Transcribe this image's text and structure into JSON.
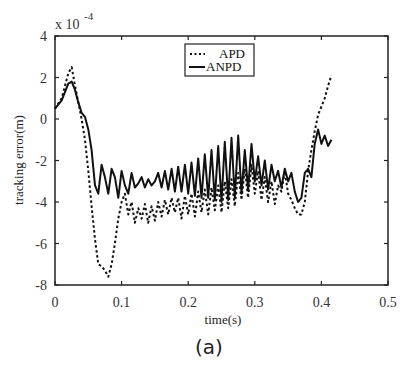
{
  "chart_data": {
    "type": "line",
    "title": "",
    "xlabel": "time(s)",
    "ylabel": "tracking error(m)",
    "y_scale_note": "x 10",
    "y_scale_exponent": "-4",
    "xlim": [
      0,
      0.5
    ],
    "ylim": [
      -8,
      4
    ],
    "xticks": [
      "0",
      "0.1",
      "0.2",
      "0.3",
      "0.4",
      "0.5"
    ],
    "yticks": [
      "4",
      "2",
      "0",
      "-2",
      "-4",
      "-6",
      "-8"
    ],
    "grid": false,
    "legend_position": "top-center",
    "caption": "(a)",
    "series": [
      {
        "name": "APD",
        "style": "dotted",
        "x": [
          0,
          0.01,
          0.02,
          0.025,
          0.03,
          0.035,
          0.04,
          0.045,
          0.05,
          0.055,
          0.06,
          0.065,
          0.07,
          0.075,
          0.08,
          0.085,
          0.09,
          0.095,
          0.1,
          0.105,
          0.11,
          0.115,
          0.12,
          0.125,
          0.13,
          0.135,
          0.14,
          0.145,
          0.15,
          0.155,
          0.16,
          0.165,
          0.17,
          0.175,
          0.18,
          0.185,
          0.19,
          0.195,
          0.2,
          0.205,
          0.21,
          0.215,
          0.22,
          0.225,
          0.23,
          0.235,
          0.24,
          0.245,
          0.25,
          0.255,
          0.26,
          0.265,
          0.27,
          0.275,
          0.28,
          0.285,
          0.29,
          0.295,
          0.3,
          0.305,
          0.31,
          0.315,
          0.32,
          0.325,
          0.33,
          0.335,
          0.34,
          0.345,
          0.35,
          0.355,
          0.36,
          0.365,
          0.37,
          0.375,
          0.38,
          0.385,
          0.39,
          0.395,
          0.4,
          0.405,
          0.41,
          0.415
        ],
        "y": [
          0.5,
          1.0,
          2.2,
          2.5,
          1.6,
          0.8,
          0.0,
          -1.0,
          -2.5,
          -4.2,
          -5.8,
          -7.0,
          -7.1,
          -7.3,
          -7.6,
          -7.0,
          -6.0,
          -4.8,
          -4.0,
          -3.6,
          -4.6,
          -4.0,
          -5.0,
          -4.3,
          -4.8,
          -4.1,
          -5.0,
          -4.2,
          -4.9,
          -4.0,
          -4.7,
          -3.9,
          -4.6,
          -3.8,
          -4.5,
          -3.8,
          -4.8,
          -3.7,
          -4.6,
          -3.6,
          -4.7,
          -3.5,
          -4.5,
          -3.4,
          -4.6,
          -3.3,
          -4.4,
          -3.2,
          -4.5,
          -3.0,
          -4.3,
          -2.9,
          -4.2,
          -2.6,
          -3.9,
          -2.4,
          -3.8,
          -2.2,
          -3.6,
          -2.5,
          -3.9,
          -2.8,
          -4.0,
          -3.0,
          -4.1,
          -3.2,
          -3.5,
          -2.5,
          -3.6,
          -3.9,
          -4.3,
          -4.6,
          -4.6,
          -4.0,
          -2.5,
          -1.5,
          -0.6,
          0.2,
          0.6,
          1.0,
          1.6,
          2.1
        ]
      },
      {
        "name": "ANPD",
        "style": "solid",
        "x": [
          0,
          0.01,
          0.02,
          0.025,
          0.03,
          0.035,
          0.04,
          0.045,
          0.05,
          0.055,
          0.06,
          0.065,
          0.07,
          0.075,
          0.08,
          0.085,
          0.09,
          0.095,
          0.1,
          0.105,
          0.11,
          0.115,
          0.12,
          0.125,
          0.13,
          0.135,
          0.14,
          0.145,
          0.15,
          0.155,
          0.16,
          0.165,
          0.17,
          0.175,
          0.18,
          0.185,
          0.19,
          0.195,
          0.2,
          0.205,
          0.21,
          0.215,
          0.22,
          0.225,
          0.23,
          0.235,
          0.24,
          0.245,
          0.25,
          0.255,
          0.26,
          0.265,
          0.27,
          0.275,
          0.28,
          0.285,
          0.29,
          0.295,
          0.3,
          0.305,
          0.31,
          0.315,
          0.32,
          0.325,
          0.33,
          0.335,
          0.34,
          0.345,
          0.35,
          0.355,
          0.36,
          0.365,
          0.37,
          0.375,
          0.38,
          0.385,
          0.39,
          0.395,
          0.4,
          0.405,
          0.41,
          0.415
        ],
        "y": [
          0.5,
          0.9,
          1.7,
          1.8,
          1.4,
          0.8,
          0.3,
          0.1,
          -0.5,
          -1.5,
          -3.2,
          -3.6,
          -2.2,
          -2.8,
          -3.6,
          -2.4,
          -2.8,
          -3.8,
          -2.5,
          -3.2,
          -3.6,
          -2.6,
          -3.3,
          -3.1,
          -2.8,
          -3.3,
          -2.9,
          -3.2,
          -3.0,
          -2.6,
          -3.3,
          -2.5,
          -3.4,
          -2.4,
          -3.5,
          -2.3,
          -3.5,
          -2.2,
          -3.6,
          -2.1,
          -3.7,
          -1.9,
          -3.8,
          -1.7,
          -3.8,
          -1.5,
          -3.9,
          -1.3,
          -4.0,
          -1.1,
          -3.9,
          -0.9,
          -3.8,
          -0.8,
          -3.6,
          -1.5,
          -3.4,
          -1.2,
          -3.0,
          -1.8,
          -3.2,
          -2.0,
          -3.4,
          -2.2,
          -3.0,
          -2.5,
          -3.3,
          -2.4,
          -3.0,
          -2.6,
          -3.5,
          -4.0,
          -3.8,
          -2.6,
          -2.4,
          -2.8,
          -1.2,
          -0.5,
          -1.2,
          -0.8,
          -1.3,
          -1.0
        ]
      }
    ]
  },
  "axes": {
    "xlabel": "time(s)",
    "ylabel": "tracking error(m)",
    "scale_prefix": "x 10",
    "scale_exp": "-4"
  },
  "legend": {
    "items": [
      {
        "label": "APD",
        "style": "dotted"
      },
      {
        "label": "ANPD",
        "style": "solid"
      }
    ]
  },
  "caption": "(a)",
  "colors": {
    "line": "#1a1a1a",
    "axis": "#222222",
    "background": "#ffffff"
  }
}
